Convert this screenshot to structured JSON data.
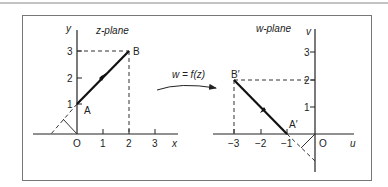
{
  "figure": {
    "z_plane": {
      "title": "z-plane",
      "x_axis_label": "x",
      "y_axis_label": "y",
      "origin_label": "O",
      "x_ticks": [
        "1",
        "2",
        "3"
      ],
      "y_ticks": [
        "1",
        "2",
        "3"
      ],
      "points": [
        {
          "label": "A",
          "x": 0,
          "y": 1
        },
        {
          "label": "B",
          "x": 2,
          "y": 3
        }
      ]
    },
    "mapping": {
      "label": "w = f(z)"
    },
    "w_plane": {
      "title": "w-plane",
      "u_axis_label": "u",
      "v_axis_label": "v",
      "origin_label": "O",
      "u_ticks": [
        "−3",
        "−2",
        "−1"
      ],
      "v_ticks": [
        "1",
        "2",
        "3"
      ],
      "points": [
        {
          "label": "A′",
          "u": -1,
          "v": 0
        },
        {
          "label": "B′",
          "u": -3,
          "v": 2
        }
      ]
    }
  }
}
